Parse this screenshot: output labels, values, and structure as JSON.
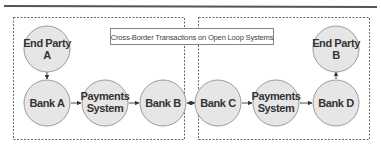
{
  "diagram": {
    "title": "Cross-Border Transactions on Open Loop Systems",
    "colors": {
      "node_fill": "#e6e6e6",
      "node_stroke": "#9a9a9a",
      "text": "#333333",
      "dashed_border": "#555555",
      "top_rule": "#555555"
    },
    "regions": [
      {
        "id": "left-domain",
        "label": ""
      },
      {
        "id": "right-domain",
        "label": ""
      }
    ],
    "nodes": [
      {
        "id": "end-party-a",
        "line1": "End Party",
        "line2": "A"
      },
      {
        "id": "bank-a",
        "line1": "Bank A",
        "line2": ""
      },
      {
        "id": "payments-system-left",
        "line1": "Payments",
        "line2": "System"
      },
      {
        "id": "bank-b",
        "line1": "Bank B",
        "line2": ""
      },
      {
        "id": "bank-c",
        "line1": "Bank C",
        "line2": ""
      },
      {
        "id": "payments-system-right",
        "line1": "Payments",
        "line2": "System"
      },
      {
        "id": "bank-d",
        "line1": "Bank D",
        "line2": ""
      },
      {
        "id": "end-party-b",
        "line1": "End Party",
        "line2": "B"
      }
    ],
    "edges": [
      {
        "from": "end-party-a",
        "to": "bank-a",
        "direction": "forward"
      },
      {
        "from": "bank-a",
        "to": "payments-system-left",
        "direction": "forward"
      },
      {
        "from": "payments-system-left",
        "to": "bank-b",
        "direction": "forward"
      },
      {
        "from": "bank-b",
        "to": "bank-c",
        "direction": "both"
      },
      {
        "from": "bank-c",
        "to": "payments-system-right",
        "direction": "forward"
      },
      {
        "from": "payments-system-right",
        "to": "bank-d",
        "direction": "forward"
      },
      {
        "from": "bank-d",
        "to": "end-party-b",
        "direction": "forward"
      }
    ]
  }
}
